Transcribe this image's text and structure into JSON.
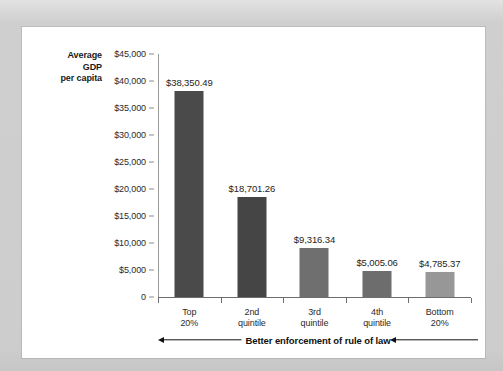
{
  "chart_data": {
    "type": "bar",
    "title": "",
    "xlabel": "Better enforcement of rule of law",
    "ylabel": "Average GDP per capita",
    "ylabel_lines": [
      "Average",
      "GDP",
      "per capita"
    ],
    "categories": [
      "Top 20%",
      "2nd quintile",
      "3rd quintile",
      "4th quintile",
      "Bottom 20%"
    ],
    "category_lines": [
      [
        "Top",
        "20%"
      ],
      [
        "2nd",
        "quintile"
      ],
      [
        "3rd",
        "quintile"
      ],
      [
        "4th",
        "quintile"
      ],
      [
        "Bottom",
        "20%"
      ]
    ],
    "values": [
      38350.49,
      18701.26,
      9316.34,
      5005.06,
      4785.37
    ],
    "value_labels": [
      "$38,350.49",
      "$18,701.26",
      "$9,316.34",
      "$5,005.06",
      "$4,785.37"
    ],
    "bar_colors": [
      "#4a4a4a",
      "#454545",
      "#6f6f6f",
      "#6d6d6d",
      "#979797"
    ],
    "ylim": [
      0,
      45000
    ],
    "ytick_values": [
      45000,
      40000,
      35000,
      30000,
      25000,
      20000,
      15000,
      10000,
      5000,
      0
    ],
    "ytick_labels": [
      "$45,000",
      "$40,000",
      "$35,000",
      "$30,000",
      "$25,000",
      "$20,000",
      "$15,000",
      "$10,000",
      "$5,000",
      "0"
    ],
    "grid": false,
    "legend": null,
    "annotations": [
      {
        "name": "left-arrow",
        "direction": "left"
      },
      {
        "name": "right-arrow",
        "direction": "left"
      }
    ]
  },
  "colors": {
    "page_background": "#d2d2d2",
    "panel_background": "#ffffff",
    "axis": "#6d6d6d",
    "text": "#1b1b1b"
  }
}
